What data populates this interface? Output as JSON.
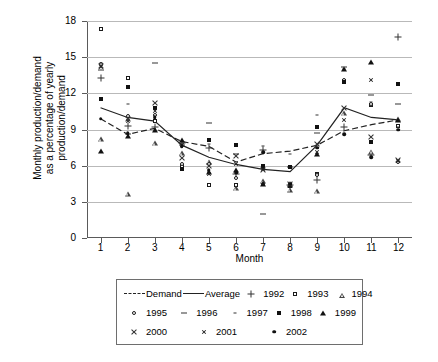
{
  "chart_data": {
    "type": "scatter",
    "title": "",
    "xlabel": "Month",
    "ylabel": "Monthly production/demand as a percentage of yearly production/demand",
    "ylabel_lines": [
      "Monthly production/demand",
      "as a percentage of yearly",
      "production/demand"
    ],
    "x": [
      1,
      2,
      3,
      4,
      5,
      6,
      7,
      8,
      9,
      10,
      11,
      12
    ],
    "xtick_labels": [
      "1",
      "2",
      "3",
      "4",
      "5",
      "6",
      "7",
      "8",
      "9",
      "10",
      "11",
      "12"
    ],
    "ytick_labels": [
      "0",
      "3",
      "6",
      "9",
      "12",
      "15",
      "18"
    ],
    "yticks": [
      0,
      3,
      6,
      9,
      12,
      15,
      18
    ],
    "ylim": [
      0,
      18
    ],
    "xlim": [
      0.5,
      12.5
    ],
    "grid": "horizontal",
    "legend_position": "below-plot",
    "series": [
      {
        "name": "Demand",
        "marker": "dashed-line",
        "values": [
          9.9,
          8.6,
          9.1,
          8.0,
          7.6,
          6.3,
          7.0,
          7.2,
          7.7,
          8.9,
          9.4,
          9.8
        ]
      },
      {
        "name": "Average",
        "marker": "solid-line",
        "values": [
          10.8,
          10.0,
          9.7,
          7.7,
          6.7,
          6.1,
          5.7,
          5.5,
          7.7,
          10.8,
          10.0,
          9.8
        ]
      },
      {
        "name": "1992",
        "marker": "plus",
        "values": [
          13.3,
          9.3,
          9.2,
          7.9,
          7.5,
          5.3,
          7.3,
          4.4,
          4.8,
          9.2,
          6.9,
          16.7
        ]
      },
      {
        "name": "1993",
        "marker": "open-square",
        "values": [
          17.3,
          13.3,
          9.7,
          6.0,
          4.4,
          4.4,
          5.9,
          4.3,
          5.3,
          13.0,
          11.0,
          9.3
        ]
      },
      {
        "name": "1994",
        "marker": "open-triangle",
        "values": [
          8.2,
          4.1,
          8.7,
          8.3,
          8.0,
          6.2,
          7.2,
          6.9,
          7.2,
          14.1,
          11.3,
          14.4
        ]
      },
      {
        "name": "1995",
        "marker": "open-circle",
        "values": [
          14.4,
          10.1,
          10.2,
          6.1,
          6.1,
          5.0,
          4.5,
          4.4,
          5.2,
          13.1,
          11.1,
          6.3
        ]
      },
      {
        "name": "1996",
        "marker": "long-dash",
        "values": [
          13.9,
          8.6,
          14.5,
          7.7,
          9.5,
          7.0,
          2.0,
          5.9,
          8.7,
          14.2,
          11.9,
          11.1
        ]
      },
      {
        "name": "1997",
        "marker": "short-tick",
        "values": [
          14.5,
          11.1,
          9.0,
          7.8,
          7.8,
          7.7,
          7.6,
          7.0,
          10.2,
          14.0,
          11.3,
          9.2
        ]
      },
      {
        "name": "1998",
        "marker": "filled-square",
        "values": [
          11.5,
          12.5,
          10.8,
          5.7,
          8.1,
          7.7,
          6.0,
          5.9,
          9.2,
          12.9,
          8.0,
          12.8
        ]
      },
      {
        "name": "1999",
        "marker": "filled-triangle",
        "values": [
          7.2,
          8.5,
          9.0,
          8.1,
          5.5,
          5.6,
          4.5,
          4.4,
          7.0,
          14.0,
          14.6,
          9.8
        ]
      },
      {
        "name": "2000",
        "marker": "cross-x",
        "values": [
          14.3,
          9.9,
          11.2,
          6.6,
          6.0,
          6.8,
          5.6,
          4.5,
          7.8,
          10.8,
          8.4,
          6.5
        ]
      },
      {
        "name": "2001",
        "marker": "star-x",
        "values": [
          14.2,
          9.7,
          10.5,
          7.7,
          5.3,
          6.1,
          5.7,
          4.4,
          7.1,
          9.8,
          13.1,
          6.4
        ]
      },
      {
        "name": "2002",
        "marker": "filled-circle",
        "values": [
          9.9,
          8.7,
          10.0,
          7.6,
          5.6,
          5.4,
          7.1,
          4.5,
          7.5,
          8.6,
          6.7,
          9.0
        ]
      }
    ],
    "legend_rows": [
      [
        {
          "label": "Demand",
          "key": "dashed-line"
        },
        {
          "label": "Average",
          "key": "solid-line"
        },
        {
          "label": "1992",
          "key": "plus"
        },
        {
          "label": "1993",
          "key": "open-square"
        },
        {
          "label": "1994",
          "key": "open-triangle"
        }
      ],
      [
        {
          "label": "1995",
          "key": "open-circle"
        },
        {
          "label": "1996",
          "key": "long-dash"
        },
        {
          "label": "1997",
          "key": "short-tick"
        },
        {
          "label": "1998",
          "key": "filled-square"
        },
        {
          "label": "1999",
          "key": "filled-triangle"
        }
      ],
      [
        {
          "label": "2000",
          "key": "cross-x"
        },
        {
          "label": "2001",
          "key": "star-x"
        },
        {
          "label": "2002",
          "key": "filled-circle"
        }
      ]
    ],
    "colors": {
      "axis": "#5a5a5a",
      "grid": "#b9b9b9",
      "marker": "#111111",
      "line": "#222222"
    }
  }
}
